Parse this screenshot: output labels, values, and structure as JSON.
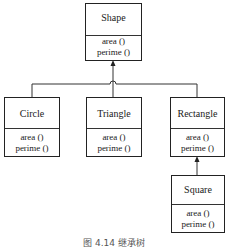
{
  "diagram": {
    "type": "uml-class-inheritance",
    "classes": [
      {
        "id": "shape",
        "name": "Shape",
        "methods": [
          "area ()",
          "perime ()"
        ]
      },
      {
        "id": "circle",
        "name": "Circle",
        "methods": [
          "area ()",
          "perime ()"
        ],
        "extends": "Shape"
      },
      {
        "id": "triangle",
        "name": "Triangle",
        "methods": [
          "area ()",
          "perime ()"
        ],
        "extends": "Shape"
      },
      {
        "id": "rectangle",
        "name": "Rectangle",
        "methods": [
          "area ()",
          "perime ()"
        ],
        "extends": "Shape"
      },
      {
        "id": "square",
        "name": "Square",
        "methods": [
          "area ()",
          "perime ()"
        ],
        "extends": "Rectangle"
      }
    ],
    "caption": "图 4.14  继承树"
  }
}
